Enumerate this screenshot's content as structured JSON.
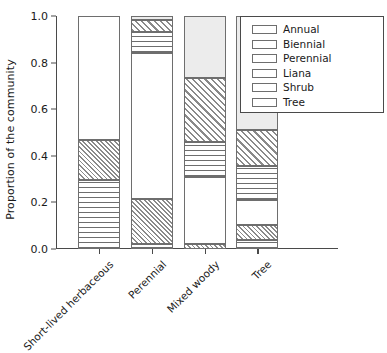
{
  "chart_data": {
    "type": "bar",
    "subtype": "stacked-bar-100",
    "title": "",
    "xlabel": "",
    "ylabel": "Proportion of the community",
    "ylim": [
      0.0,
      1.0
    ],
    "yticks": [
      "0.0",
      "0.2",
      "0.4",
      "0.6",
      "0.8",
      "1.0"
    ],
    "ytick_values": [
      0.0,
      0.2,
      0.4,
      0.6,
      0.8,
      1.0
    ],
    "grid": false,
    "legend_position": "top-right",
    "categories": [
      "Short-lived herbaceous",
      "Perennial",
      "Mixed woody",
      "Tree"
    ],
    "series": [
      {
        "name": "Annual",
        "fill": "horizontal-lines",
        "values": [
          0.295,
          0.02,
          0.0,
          0.04
        ]
      },
      {
        "name": "Biennial",
        "fill": "cross-hatch",
        "values": [
          0.175,
          0.195,
          0.02,
          0.065
        ]
      },
      {
        "name": "Perennial",
        "fill": "blank-white",
        "values": [
          0.53,
          0.625,
          0.29,
          0.105
        ]
      },
      {
        "name": "Liana",
        "fill": "horizontal-lines",
        "values": [
          0.0,
          0.09,
          0.15,
          0.145
        ]
      },
      {
        "name": "Shrub",
        "fill": "diagonal-hatch",
        "values": [
          0.0,
          0.055,
          0.275,
          0.155
        ]
      },
      {
        "name": "Tree",
        "fill": "light-grey",
        "values": [
          0.0,
          0.015,
          0.265,
          0.49
        ]
      }
    ],
    "stack_boundaries": {
      "Short-lived herbaceous": [
        0.0,
        0.295,
        0.47,
        1.0,
        1.0,
        1.0,
        1.0
      ],
      "Perennial": [
        0.0,
        0.02,
        0.215,
        0.84,
        0.93,
        0.985,
        1.0
      ],
      "Mixed woody": [
        0.0,
        0.0,
        0.02,
        0.31,
        0.46,
        0.735,
        1.0
      ],
      "Tree": [
        0.0,
        0.04,
        0.105,
        0.21,
        0.355,
        0.51,
        1.0
      ]
    }
  },
  "legend": {
    "items": [
      {
        "label": "Annual"
      },
      {
        "label": "Biennial"
      },
      {
        "label": "Perennial"
      },
      {
        "label": "Liana"
      },
      {
        "label": "Shrub"
      },
      {
        "label": "Tree"
      }
    ]
  },
  "colors": {
    "axis": "#4a4a4a",
    "segment_border": "#6e6e6e",
    "hatch": "#8a8a8a",
    "tree_fill": "#ececec",
    "background": "#ffffff",
    "text": "#1a1a1a"
  }
}
